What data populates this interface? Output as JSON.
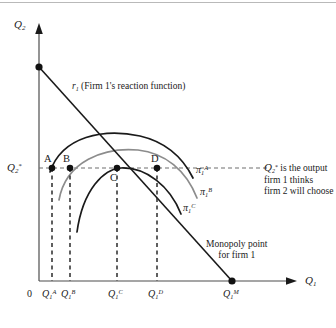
{
  "figure": {
    "type": "economics-isoprofit-diagram",
    "background": "#ffffff",
    "width": 336,
    "height": 328
  },
  "axes": {
    "y_label_base": "Q",
    "y_label_sub": "2",
    "x_label_base": "Q",
    "x_label_sub": "1",
    "origin_label": "0",
    "axis_color": "#4d4d4d"
  },
  "y_marker": {
    "base": "Q",
    "sub": "2",
    "sup": "*",
    "description": "Q2* is the output firm 1 thinks firm 2 will choose"
  },
  "x_ticks": [
    {
      "base": "Q",
      "sub": "1",
      "sup": "A",
      "x": 52
    },
    {
      "base": "Q",
      "sub": "1",
      "sup": "B",
      "x": 70
    },
    {
      "base": "Q",
      "sub": "1",
      "sup": "C",
      "x": 117
    },
    {
      "base": "Q",
      "sub": "1",
      "sup": "D",
      "x": 157
    },
    {
      "base": "Q",
      "sub": "1",
      "sup": "M",
      "x": 232
    }
  ],
  "points": [
    {
      "label": "A",
      "x": 52,
      "y": 168
    },
    {
      "label": "B",
      "x": 70,
      "y": 168
    },
    {
      "label": "C",
      "x": 117,
      "y": 168
    },
    {
      "label": "D",
      "x": 157,
      "y": 168
    },
    {
      "label": "",
      "x": 39,
      "y": 67
    },
    {
      "label": "",
      "x": 232,
      "y": 281
    }
  ],
  "reaction_function": {
    "symbol": "r",
    "sub": "1",
    "text": "(Firm 1's reaction function)",
    "color": "#1a1a1a",
    "from": {
      "x": 39,
      "y": 67
    },
    "to": {
      "x": 232,
      "y": 281
    }
  },
  "isoprofit_curves": [
    {
      "name": "pi-1-A",
      "base": "π",
      "sub": "1",
      "sup": "A",
      "color": "#1a1a1a",
      "label_x": 196,
      "label_y": 165,
      "passes_through": [
        "A",
        "D"
      ]
    },
    {
      "name": "pi-1-B",
      "base": "π",
      "sub": "1",
      "sup": "B",
      "color": "#8c8c8c",
      "label_x": 200,
      "label_y": 187,
      "passes_through": [
        "B"
      ]
    },
    {
      "name": "pi-1-C",
      "base": "π",
      "sub": "1",
      "sup": "C",
      "color": "#1a1a1a",
      "label_x": 184,
      "label_y": 203,
      "passes_through": [
        "C"
      ]
    }
  ],
  "annotations": {
    "monopoly": {
      "line1": "Monopoly point",
      "line2": "for firm 1",
      "x": 208,
      "y": 243
    },
    "q2star_note": {
      "line1_prefix": "",
      "line1_suffix": " is the output",
      "line2": "firm 1 thinks",
      "line3": "firm 2 will choose",
      "x": 264,
      "y": 163
    }
  },
  "colors": {
    "ink": "#1a1a1a",
    "gray_curve": "#8c8c8c",
    "axis": "#4d4d4d",
    "dashed": "#2b2b2b",
    "rule": "#b9b9b9"
  }
}
